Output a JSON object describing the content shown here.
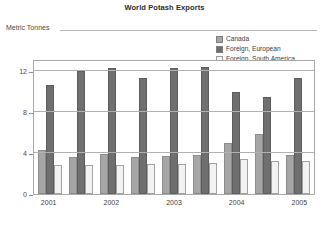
{
  "chart_data": {
    "type": "bar",
    "title": "World Potash Exports",
    "xlabel": "",
    "ylabel": "Metric Tonnes",
    "ylim": [
      0,
      13.2
    ],
    "yticks": [
      0,
      4,
      8,
      12
    ],
    "ytick_labels": [
      "0",
      "4",
      "8",
      "12"
    ],
    "grid": true,
    "legend_position": "top-right",
    "categories": [
      "2001",
      "2001",
      "2002",
      "2002",
      "2003",
      "2003",
      "2004",
      "2004",
      "2005"
    ],
    "xtick_labels": [
      "2001",
      "2002",
      "2003",
      "2004",
      "2005"
    ],
    "series": [
      {
        "name": "Canada",
        "color": "#a6a6a6",
        "values": [
          4.3,
          3.6,
          3.9,
          3.6,
          3.7,
          3.8,
          5.0,
          5.9,
          3.8
        ]
      },
      {
        "name": "Foreign, European",
        "color": "#6f6f6f",
        "values": [
          10.7,
          12.0,
          12.3,
          11.3,
          12.3,
          12.4,
          10.0,
          9.5,
          11.3
        ]
      },
      {
        "name": "Foreign, South America",
        "color": "#f2f2f2",
        "values": [
          2.8,
          2.8,
          2.8,
          2.9,
          2.9,
          3.0,
          3.4,
          3.2,
          3.2
        ]
      }
    ]
  },
  "legend": {
    "entries": [
      {
        "label": "Canada",
        "swatch": "#a6a6a6"
      },
      {
        "label": "Foreign, European",
        "swatch": "#6f6f6f"
      },
      {
        "label": "Foreign, South America",
        "swatch": "#f7f7f7"
      }
    ]
  }
}
